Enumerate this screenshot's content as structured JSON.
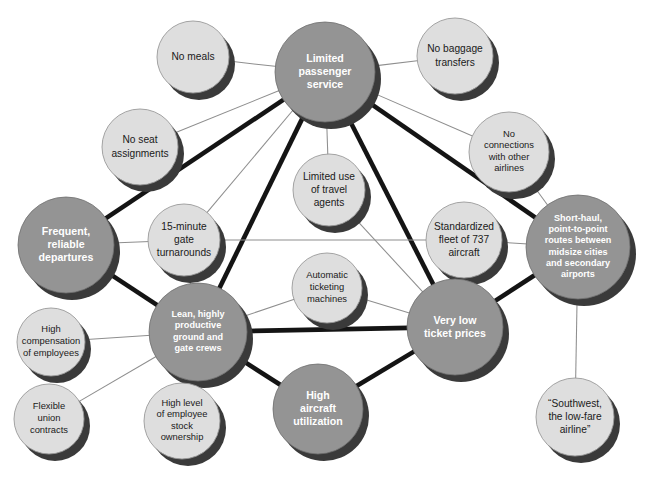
{
  "diagram": {
    "background_color": "#ffffff",
    "colors": {
      "primary_node_fill": "#949494",
      "secondary_node_fill": "#dedede",
      "node_shadow": "#3a3a3a",
      "primary_label_color": "#ffffff",
      "secondary_label_color": "#1a1a1a",
      "thick_edge_color": "#141414",
      "thin_edge_color": "#8e8e8e"
    },
    "nodes": [
      {
        "id": "no-meals",
        "label": "No meals",
        "lines": [
          "No meals"
        ],
        "kind": "secondary",
        "cx": 193,
        "cy": 57,
        "r": 36
      },
      {
        "id": "limited-passenger-service",
        "label": "Limited passenger service",
        "lines": [
          "Limited",
          "passenger",
          "service"
        ],
        "kind": "primary",
        "cx": 325,
        "cy": 72,
        "r": 50
      },
      {
        "id": "no-baggage-transfers",
        "label": "No baggage transfers",
        "lines": [
          "No baggage",
          "transfers"
        ],
        "kind": "secondary",
        "cx": 455,
        "cy": 56,
        "r": 38
      },
      {
        "id": "no-seat-assignments",
        "label": "No seat assignments",
        "lines": [
          "No seat",
          "assignments"
        ],
        "kind": "secondary",
        "cx": 140,
        "cy": 147,
        "r": 38
      },
      {
        "id": "no-connections-other-airlines",
        "label": "No connections with other airlines",
        "lines": [
          "No",
          "connections",
          "with other",
          "airlines"
        ],
        "kind": "secondary",
        "cx": 509,
        "cy": 152,
        "r": 40
      },
      {
        "id": "limited-use-travel-agents",
        "label": "Limited use of travel agents",
        "lines": [
          "Limited use",
          "of travel",
          "agents"
        ],
        "kind": "secondary",
        "cx": 329,
        "cy": 190,
        "r": 36
      },
      {
        "id": "fifteen-minute-gate-turnarounds",
        "label": "15-minute gate turnarounds",
        "lines": [
          "15-minute",
          "gate",
          "turnarounds"
        ],
        "kind": "secondary",
        "cx": 184,
        "cy": 240,
        "r": 36
      },
      {
        "id": "frequent-reliable-departures",
        "label": "Frequent, reliable departures",
        "lines": [
          "Frequent,",
          "reliable",
          "departures"
        ],
        "kind": "primary",
        "cx": 66,
        "cy": 245,
        "r": 48
      },
      {
        "id": "standardized-fleet-737",
        "label": "Standardized fleet of 737 aircraft",
        "lines": [
          "Standardized",
          "fleet of 737",
          "aircraft"
        ],
        "kind": "secondary",
        "cx": 464,
        "cy": 240,
        "r": 38
      },
      {
        "id": "short-haul-point-to-point",
        "label": "Short-haul, point-to-point routes between midsize cities and secondary airports",
        "lines": [
          "Short-haul,",
          "point-to-point",
          "routes between",
          "midsize cities",
          "and secondary",
          "airports"
        ],
        "kind": "primary",
        "cx": 578,
        "cy": 247,
        "r": 52
      },
      {
        "id": "automatic-ticketing-machines",
        "label": "Automatic ticketing machines",
        "lines": [
          "Automatic",
          "ticketing",
          "machines"
        ],
        "kind": "secondary",
        "cx": 327,
        "cy": 288,
        "r": 35
      },
      {
        "id": "lean-productive-crews",
        "label": "Lean, highly productive ground and gate crews",
        "lines": [
          "Lean, highly",
          "productive",
          "ground and",
          "gate crews"
        ],
        "kind": "primary",
        "cx": 198,
        "cy": 332,
        "r": 49
      },
      {
        "id": "very-low-ticket-prices",
        "label": "Very low ticket prices",
        "lines": [
          "Very low",
          "ticket prices"
        ],
        "kind": "primary",
        "cx": 455,
        "cy": 327,
        "r": 48
      },
      {
        "id": "high-compensation-employees",
        "label": "High compensation of employees",
        "lines": [
          "High",
          "compensation",
          "of employees"
        ],
        "kind": "secondary",
        "cx": 51,
        "cy": 342,
        "r": 34
      },
      {
        "id": "flexible-union-contracts",
        "label": "Flexible union contracts",
        "lines": [
          "Flexible",
          "union",
          "contracts"
        ],
        "kind": "secondary",
        "cx": 49,
        "cy": 419,
        "r": 35
      },
      {
        "id": "high-employee-stock-ownership",
        "label": "High level of employee stock ownership",
        "lines": [
          "High level",
          "of employee",
          "stock",
          "ownership"
        ],
        "kind": "secondary",
        "cx": 182,
        "cy": 421,
        "r": 38
      },
      {
        "id": "high-aircraft-utilization",
        "label": "High aircraft utilization",
        "lines": [
          "High",
          "aircraft",
          "utilization"
        ],
        "kind": "primary",
        "cx": 318,
        "cy": 409,
        "r": 45
      },
      {
        "id": "southwest-low-fare-airline",
        "label": "“Southwest, the low-fare airline”",
        "lines": [
          "“Southwest,",
          "the low-fare",
          "airline”"
        ],
        "kind": "secondary",
        "cx": 575,
        "cy": 417,
        "r": 39
      }
    ],
    "edges": [
      {
        "from": "limited-passenger-service",
        "to": "no-meals",
        "weight": "thin"
      },
      {
        "from": "limited-passenger-service",
        "to": "no-baggage-transfers",
        "weight": "thin"
      },
      {
        "from": "limited-passenger-service",
        "to": "no-seat-assignments",
        "weight": "thin"
      },
      {
        "from": "limited-passenger-service",
        "to": "no-connections-other-airlines",
        "weight": "thin"
      },
      {
        "from": "limited-passenger-service",
        "to": "limited-use-travel-agents",
        "weight": "thin"
      },
      {
        "from": "limited-passenger-service",
        "to": "fifteen-minute-gate-turnarounds",
        "weight": "thin"
      },
      {
        "from": "limited-passenger-service",
        "to": "frequent-reliable-departures",
        "weight": "thick"
      },
      {
        "from": "limited-passenger-service",
        "to": "lean-productive-crews",
        "weight": "thick"
      },
      {
        "from": "limited-passenger-service",
        "to": "very-low-ticket-prices",
        "weight": "thick"
      },
      {
        "from": "limited-passenger-service",
        "to": "short-haul-point-to-point",
        "weight": "thick"
      },
      {
        "from": "no-connections-other-airlines",
        "to": "short-haul-point-to-point",
        "weight": "thin"
      },
      {
        "from": "frequent-reliable-departures",
        "to": "fifteen-minute-gate-turnarounds",
        "weight": "thin"
      },
      {
        "from": "frequent-reliable-departures",
        "to": "lean-productive-crews",
        "weight": "thick"
      },
      {
        "from": "fifteen-minute-gate-turnarounds",
        "to": "lean-productive-crews",
        "weight": "thin"
      },
      {
        "from": "fifteen-minute-gate-turnarounds",
        "to": "standardized-fleet-737",
        "weight": "thin"
      },
      {
        "from": "limited-use-travel-agents",
        "to": "very-low-ticket-prices",
        "weight": "thin"
      },
      {
        "from": "automatic-ticketing-machines",
        "to": "lean-productive-crews",
        "weight": "thin"
      },
      {
        "from": "automatic-ticketing-machines",
        "to": "very-low-ticket-prices",
        "weight": "thin"
      },
      {
        "from": "standardized-fleet-737",
        "to": "short-haul-point-to-point",
        "weight": "thin"
      },
      {
        "from": "standardized-fleet-737",
        "to": "very-low-ticket-prices",
        "weight": "thin"
      },
      {
        "from": "lean-productive-crews",
        "to": "very-low-ticket-prices",
        "weight": "thick"
      },
      {
        "from": "lean-productive-crews",
        "to": "high-aircraft-utilization",
        "weight": "thick"
      },
      {
        "from": "lean-productive-crews",
        "to": "high-compensation-employees",
        "weight": "thin"
      },
      {
        "from": "lean-productive-crews",
        "to": "flexible-union-contracts",
        "weight": "thin"
      },
      {
        "from": "lean-productive-crews",
        "to": "high-employee-stock-ownership",
        "weight": "thin"
      },
      {
        "from": "high-aircraft-utilization",
        "to": "very-low-ticket-prices",
        "weight": "thick"
      },
      {
        "from": "very-low-ticket-prices",
        "to": "short-haul-point-to-point",
        "weight": "thick"
      },
      {
        "from": "short-haul-point-to-point",
        "to": "southwest-low-fare-airline",
        "weight": "thin"
      }
    ]
  }
}
